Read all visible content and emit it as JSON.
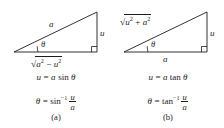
{
  "figure": {
    "type": "trigonometric-substitution-triangles",
    "background_color": "#ffffff",
    "stroke_color": "#1c1c1c",
    "text_color": "#1c1c1c"
  },
  "panel_a": {
    "caption": "(a)",
    "triangle": {
      "hypotenuse_label": "a",
      "opposite_label": "u",
      "adjacent_label_radical": "√",
      "adjacent_label_radicand_first": "a",
      "adjacent_label_radicand_first_sup": "2",
      "adjacent_label_operator": "−",
      "adjacent_label_radicand_second": "u",
      "adjacent_label_radicand_second_sup": "2",
      "adjacent_label_plain": "√(a² − u²)",
      "angle_label": "θ",
      "right_angle_marker": true
    },
    "equation_1": {
      "lhs": "u",
      "equals": "=",
      "rhs_coefficient": "a",
      "rhs_function": "sin",
      "rhs_argument": "θ",
      "plain": "u = a sin θ"
    },
    "equation_2": {
      "lhs": "θ",
      "equals": "=",
      "rhs_function": "sin",
      "rhs_exponent": "−1",
      "rhs_numerator": "u",
      "rhs_denominator": "a",
      "plain": "θ = sin⁻¹ u/a"
    }
  },
  "panel_b": {
    "caption": "(b)",
    "triangle": {
      "hypotenuse_label_radical": "√",
      "hypotenuse_radicand_first": "u",
      "hypotenuse_radicand_first_sup": "2",
      "hypotenuse_label_operator": "+",
      "hypotenuse_radicand_second": "a",
      "hypotenuse_radicand_second_sup": "2",
      "hypotenuse_label_plain": "√(u² + a²)",
      "opposite_label": "u",
      "adjacent_label": "a",
      "angle_label": "θ",
      "right_angle_marker": true
    },
    "equation_1": {
      "lhs": "u",
      "equals": "=",
      "rhs_coefficient": "a",
      "rhs_function": "tan",
      "rhs_argument": "θ",
      "plain": "u = a tan θ"
    },
    "equation_2": {
      "lhs": "θ",
      "equals": "=",
      "rhs_function": "tan",
      "rhs_exponent": "−1",
      "rhs_numerator": "u",
      "rhs_denominator": "a",
      "plain": "θ = tan⁻¹ u/a"
    }
  }
}
